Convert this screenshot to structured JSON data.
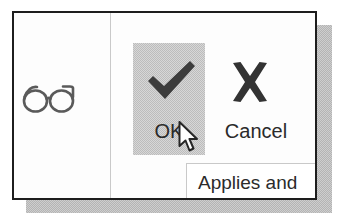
{
  "dialog": {
    "left_column": {
      "icon_name": "eyeglasses-icon"
    },
    "actions": [
      {
        "id": "ok",
        "label": "OK",
        "icon": "checkmark-icon",
        "selected": true,
        "highlight_color": "#bcbcbc"
      },
      {
        "id": "cancel",
        "label": "Cancel",
        "icon": "cross-icon",
        "selected": false
      }
    ],
    "sub_panel": {
      "text": "Applies and"
    },
    "border_color": "#1d1d1d",
    "background_color": "#fdfdfd",
    "divider_color": "#c9c9c9"
  },
  "cursor": {
    "type": "arrow-pointer",
    "x": 178,
    "y": 121
  },
  "shadow": {
    "color": "#b4b4b4"
  }
}
